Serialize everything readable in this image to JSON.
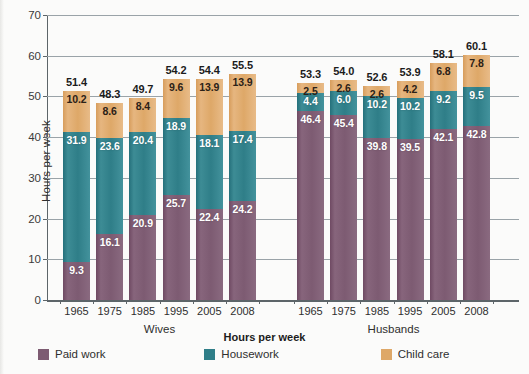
{
  "axes": {
    "ylabel": "Hours per week",
    "yticks": [
      "0",
      "10",
      "20",
      "30",
      "40",
      "50",
      "60",
      "70"
    ],
    "ymin": 0,
    "ymax": 70
  },
  "groups": [
    {
      "name": "wives-group",
      "label": "Wives"
    },
    {
      "name": "husbands-group",
      "label": "Husbands"
    }
  ],
  "legend": {
    "title": "Hours per week",
    "items": [
      {
        "label": "Paid work",
        "color": "#7d5b72",
        "key": "paid"
      },
      {
        "label": "Housework",
        "color": "#2f7e88",
        "key": "housework"
      },
      {
        "label": "Child care",
        "color": "#dea868",
        "key": "childcare"
      }
    ]
  },
  "chart_data": {
    "type": "bar",
    "subtype": "stacked",
    "title": "",
    "xlabel": "",
    "ylabel": "Hours per week",
    "ylim": [
      0,
      70
    ],
    "ytick_step": 10,
    "grid": true,
    "legend_position": "bottom",
    "group_labels": [
      "Wives",
      "Husbands"
    ],
    "categories": [
      "1965",
      "1975",
      "1985",
      "1995",
      "2005",
      "2008"
    ],
    "series": [
      {
        "name": "Paid work",
        "color": "#7d5b72",
        "wives": [
          9.3,
          16.1,
          20.9,
          25.7,
          22.4,
          24.2
        ],
        "husbands": [
          46.4,
          45.4,
          39.8,
          39.5,
          42.1,
          42.8
        ]
      },
      {
        "name": "Housework",
        "color": "#2f7e88",
        "wives": [
          31.9,
          23.6,
          20.4,
          18.9,
          18.1,
          17.4
        ],
        "husbands": [
          4.4,
          6.0,
          10.2,
          10.2,
          9.2,
          9.5
        ]
      },
      {
        "name": "Child care",
        "color": "#dea868",
        "wives": [
          10.2,
          8.6,
          8.4,
          9.6,
          13.9,
          13.9
        ],
        "husbands": [
          2.5,
          2.6,
          2.6,
          4.2,
          6.8,
          7.8
        ]
      }
    ],
    "totals": {
      "wives": [
        51.4,
        48.3,
        49.7,
        54.2,
        54.4,
        55.5
      ],
      "husbands": [
        53.3,
        54.0,
        52.6,
        53.9,
        58.1,
        60.1
      ]
    },
    "bars": [
      {
        "group": "Wives",
        "year": "1965",
        "paid": 9.3,
        "housework": 31.9,
        "childcare": 10.2,
        "total": 51.4,
        "paid_label": "9.3",
        "housework_label": "31.9",
        "childcare_label": "10.2",
        "total_label": "51.4"
      },
      {
        "group": "Wives",
        "year": "1975",
        "paid": 16.1,
        "housework": 23.6,
        "childcare": 8.6,
        "total": 48.3,
        "paid_label": "16.1",
        "housework_label": "23.6",
        "childcare_label": "8.6",
        "total_label": "48.3"
      },
      {
        "group": "Wives",
        "year": "1985",
        "paid": 20.9,
        "housework": 20.4,
        "childcare": 8.4,
        "total": 49.7,
        "paid_label": "20.9",
        "housework_label": "20.4",
        "childcare_label": "8.4",
        "total_label": "49.7"
      },
      {
        "group": "Wives",
        "year": "1995",
        "paid": 25.7,
        "housework": 18.9,
        "childcare": 9.6,
        "total": 54.2,
        "paid_label": "25.7",
        "housework_label": "18.9",
        "childcare_label": "9.6",
        "total_label": "54.2"
      },
      {
        "group": "Wives",
        "year": "2005",
        "paid": 22.4,
        "housework": 18.1,
        "childcare": 13.9,
        "total": 54.4,
        "paid_label": "22.4",
        "housework_label": "18.1",
        "childcare_label": "13.9",
        "total_label": "54.4"
      },
      {
        "group": "Wives",
        "year": "2008",
        "paid": 24.2,
        "housework": 17.4,
        "childcare": 13.9,
        "total": 55.5,
        "paid_label": "24.2",
        "housework_label": "17.4",
        "childcare_label": "13.9",
        "total_label": "55.5"
      },
      {
        "group": "Husbands",
        "year": "1965",
        "paid": 46.4,
        "housework": 4.4,
        "childcare": 2.5,
        "total": 53.3,
        "paid_label": "46.4",
        "housework_label": "4.4",
        "childcare_label": "2.5",
        "total_label": "53.3"
      },
      {
        "group": "Husbands",
        "year": "1975",
        "paid": 45.4,
        "housework": 6.0,
        "childcare": 2.6,
        "total": 54.0,
        "paid_label": "45.4",
        "housework_label": "6.0",
        "childcare_label": "2.6",
        "total_label": "54.0"
      },
      {
        "group": "Husbands",
        "year": "1985",
        "paid": 39.8,
        "housework": 10.2,
        "childcare": 2.6,
        "total": 52.6,
        "paid_label": "39.8",
        "housework_label": "10.2",
        "childcare_label": "2.6",
        "total_label": "52.6"
      },
      {
        "group": "Husbands",
        "year": "1995",
        "paid": 39.5,
        "housework": 10.2,
        "childcare": 4.2,
        "total": 53.9,
        "paid_label": "39.5",
        "housework_label": "10.2",
        "childcare_label": "4.2",
        "total_label": "53.9"
      },
      {
        "group": "Husbands",
        "year": "2005",
        "paid": 42.1,
        "housework": 9.2,
        "childcare": 6.8,
        "total": 58.1,
        "paid_label": "42.1",
        "housework_label": "9.2",
        "childcare_label": "6.8",
        "total_label": "58.1"
      },
      {
        "group": "Husbands",
        "year": "2008",
        "paid": 42.8,
        "housework": 9.5,
        "childcare": 7.8,
        "total": 60.1,
        "paid_label": "42.8",
        "housework_label": "9.5",
        "childcare_label": "7.8",
        "total_label": "60.1"
      }
    ]
  }
}
